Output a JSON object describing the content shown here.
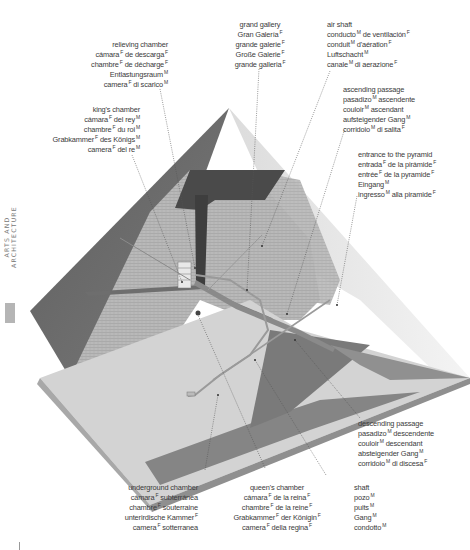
{
  "section_tab": "ARTS AND ARCHITECTURE",
  "colors": {
    "left_face": "#6b6b6b",
    "right_face": "#ececec",
    "brick_face": "#b4b4b4",
    "floor": "#d0d0d0",
    "base_edge": "#8e8e8e",
    "shadow": "#7d7d7d",
    "text": "#3a3a3a",
    "leader": "#555555"
  },
  "labels": {
    "grand_gallery": {
      "lines": [
        {
          "t": "grand gallery",
          "g": ""
        },
        {
          "t": "Gran Galería",
          "g": "F"
        },
        {
          "t": "grande galerie",
          "g": "F"
        },
        {
          "t": "Große Galerie",
          "g": "F"
        },
        {
          "t": "grande galleria",
          "g": "F"
        }
      ]
    },
    "air_shaft": {
      "lines": [
        {
          "t": "air shaft",
          "g": ""
        },
        {
          "t": "conducto",
          "g": "M",
          "rest": "de ventilación",
          "g2": "F"
        },
        {
          "t": "conduit",
          "g": "M",
          "rest": "d'aération",
          "g2": "F"
        },
        {
          "t": "Luftschacht",
          "g": "M"
        },
        {
          "t": "canale",
          "g": "M",
          "rest": "di aerazione",
          "g2": "F"
        }
      ]
    },
    "relieving_chamber": {
      "lines": [
        {
          "t": "relieving chamber",
          "g": ""
        },
        {
          "t": "cámara",
          "g": "F",
          "rest": "de descarga",
          "g2": "F"
        },
        {
          "t": "chambre",
          "g": "F",
          "rest": "de décharge",
          "g2": "F"
        },
        {
          "t": "Entlastungsraum",
          "g": "M"
        },
        {
          "t": "camera",
          "g": "F",
          "rest": "di scarico",
          "g2": "M"
        }
      ]
    },
    "kings_chamber": {
      "lines": [
        {
          "t": "king's chamber",
          "g": ""
        },
        {
          "t": "cámara",
          "g": "F",
          "rest": "del rey",
          "g2": "M"
        },
        {
          "t": "chambre",
          "g": "F",
          "rest": "du roi",
          "g2": "M"
        },
        {
          "t": "Grabkammer",
          "g": "F",
          "rest": "des Königs",
          "g2": "M"
        },
        {
          "t": "camera",
          "g": "F",
          "rest": "del re",
          "g2": "M"
        }
      ]
    },
    "ascending_passage": {
      "lines": [
        {
          "t": "ascending passage",
          "g": ""
        },
        {
          "t": "pasadizo",
          "g": "M",
          "rest": "ascendente",
          "g2": ""
        },
        {
          "t": "couloir",
          "g": "M",
          "rest": "ascendant",
          "g2": ""
        },
        {
          "t": "aufsteigender Gang",
          "g": "M"
        },
        {
          "t": "corridoio",
          "g": "M",
          "rest": "di salita",
          "g2": "F"
        }
      ]
    },
    "entrance": {
      "lines": [
        {
          "t": "entrance to the pyramid",
          "g": ""
        },
        {
          "t": "entrada",
          "g": "F",
          "rest": "de la pirámide",
          "g2": "F"
        },
        {
          "t": "entrée",
          "g": "F",
          "rest": "de la pyramide",
          "g2": "F"
        },
        {
          "t": "Eingang",
          "g": "M"
        },
        {
          "t": "ingresso",
          "g": "M",
          "rest": "alla piramide",
          "g2": "F"
        }
      ]
    },
    "descending_passage": {
      "lines": [
        {
          "t": "descending passage",
          "g": ""
        },
        {
          "t": "pasadizo",
          "g": "M",
          "rest": "descendente",
          "g2": ""
        },
        {
          "t": "couloir",
          "g": "M",
          "rest": "descendant",
          "g2": ""
        },
        {
          "t": "absteigender Gang",
          "g": "M"
        },
        {
          "t": "corridoio",
          "g": "M",
          "rest": "di discesa",
          "g2": "F"
        }
      ]
    },
    "shaft": {
      "lines": [
        {
          "t": "shaft",
          "g": ""
        },
        {
          "t": "pozo",
          "g": "M"
        },
        {
          "t": "puits",
          "g": "M"
        },
        {
          "t": "Gang",
          "g": "M"
        },
        {
          "t": "condotto",
          "g": "M"
        }
      ]
    },
    "queens_chamber": {
      "lines": [
        {
          "t": "queen's chamber",
          "g": ""
        },
        {
          "t": "cámara",
          "g": "F",
          "rest": "de la reina",
          "g2": "F"
        },
        {
          "t": "chambre",
          "g": "F",
          "rest": "de la reine",
          "g2": "F"
        },
        {
          "t": "Grabkammer",
          "g": "F",
          "rest": "der Königin",
          "g2": "F"
        },
        {
          "t": "camera",
          "g": "F",
          "rest": "della regina",
          "g2": "F"
        }
      ]
    },
    "underground_chamber": {
      "lines": [
        {
          "t": "underground chamber",
          "g": ""
        },
        {
          "t": "cámara",
          "g": "F",
          "rest": "subterránea",
          "g2": ""
        },
        {
          "t": "chambre",
          "g": "F",
          "rest": "souterraine",
          "g2": ""
        },
        {
          "t": "unterirdische Kammer",
          "g": "F"
        },
        {
          "t": "camera",
          "g": "F",
          "rest": "sotterranea",
          "g2": ""
        }
      ]
    }
  }
}
